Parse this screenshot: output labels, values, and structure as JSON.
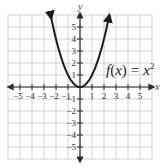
{
  "chart_data": {
    "type": "line",
    "title": "",
    "function_label": "f(x) = x²",
    "function_label_parts": {
      "name": "f",
      "arg": "x",
      "eq": "=",
      "rhs": "x",
      "exp": "2"
    },
    "xlabel": "x",
    "ylabel": "y",
    "xlim": [
      -6,
      6
    ],
    "ylim": [
      -6,
      6
    ],
    "grid": true,
    "x_ticks": [
      -5,
      -4,
      -3,
      -2,
      -1,
      1,
      2,
      3,
      4,
      5
    ],
    "y_ticks": [
      5,
      4,
      3,
      2,
      1,
      -1,
      -2,
      -3,
      -4,
      -5
    ],
    "x_tick_labels": [
      "−5",
      "−4",
      "−3",
      "−2",
      "−1",
      "1",
      "2",
      "3",
      "4",
      "5"
    ],
    "y_tick_labels": [
      "5",
      "4",
      "3",
      "2",
      "1",
      "−1",
      "−2",
      "−3",
      "−4",
      "−5"
    ],
    "series": [
      {
        "name": "f(x) = x^2",
        "x": [
          -2.5,
          -2,
          -1.5,
          -1,
          -0.5,
          0,
          0.5,
          1,
          1.5,
          2,
          2.5
        ],
        "y": [
          6.25,
          4,
          2.25,
          1,
          0.25,
          0,
          0.25,
          1,
          2.25,
          4,
          6.25
        ],
        "arrows_at_ends": true
      }
    ],
    "colors": {
      "curve": "#1c1c1c",
      "grid": "#c8c8c8",
      "axis": "#2b2b2b"
    }
  }
}
